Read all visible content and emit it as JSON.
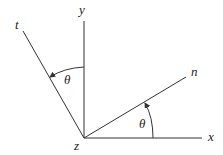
{
  "diagram": {
    "axes": {
      "x_label": "x",
      "y_label": "y",
      "z_label": "z",
      "t_label": "t",
      "n_label": "n"
    },
    "angles": {
      "theta_left": "θ",
      "theta_right": "θ"
    },
    "colors": {
      "line": "#333333",
      "background": "#ffffff"
    }
  }
}
